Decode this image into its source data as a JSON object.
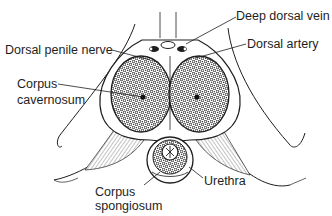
{
  "figure": {
    "type": "anatomical cross-section line drawing",
    "colors": {
      "ink": "#1e1e1e",
      "background": "#ffffff"
    }
  },
  "labels": {
    "deep_dorsal_vein": "Deep dorsal vein",
    "dorsal_artery": "Dorsal artery",
    "dorsal_penile_nerve": "Dorsal penile nerve",
    "corpus_cavernosum": {
      "line1": "Corpus",
      "line2": "cavernosum"
    },
    "corpus_spongiosum": {
      "line1": "Corpus",
      "line2": "spongiosum"
    },
    "urethra": "Urethra"
  }
}
